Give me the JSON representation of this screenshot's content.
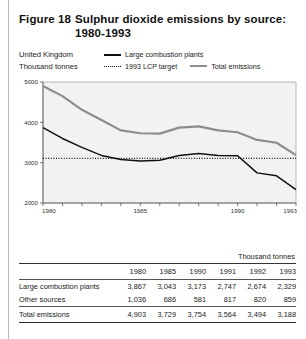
{
  "figure": {
    "number": "Figure 18",
    "title_line1": "Sulphur dioxide emissions by source:",
    "title_line2": "1980-1993"
  },
  "subhead": {
    "region": "United Kingdom",
    "units": "Thousand tonnes"
  },
  "legend": {
    "large_combustion_plants": "Large combustion plants",
    "lcp_target": "1993 LCP target",
    "total_emissions": "Total emissions"
  },
  "table": {
    "units_label": "Thousand tonnes",
    "columns": [
      "1980",
      "1985",
      "1990",
      "1991",
      "1992",
      "1993"
    ],
    "rows": [
      {
        "label": "Large combustion plants",
        "values": [
          "3,867",
          "3,043",
          "3,173",
          "2,747",
          "2,674",
          "2,329"
        ]
      },
      {
        "label": "Other sources",
        "values": [
          "1,036",
          "686",
          "581",
          "817",
          "820",
          "859"
        ]
      }
    ],
    "total_row": {
      "label": "Total emissions",
      "values": [
        "4,903",
        "3,729",
        "3,754",
        "3,564",
        "3,494",
        "3,188"
      ]
    }
  },
  "chart_data": {
    "type": "line",
    "title": "Sulphur dioxide emissions by source: 1980-1993",
    "xlabel": "",
    "ylabel": "Thousand tonnes",
    "xlim": [
      1980,
      1993
    ],
    "ylim": [
      2000,
      5000
    ],
    "yticks": [
      2000,
      3000,
      4000,
      5000
    ],
    "ytick_labels": [
      "2000",
      "3000",
      "4000",
      "5000"
    ],
    "xticks": [
      1980,
      1981,
      1982,
      1983,
      1984,
      1985,
      1986,
      1987,
      1988,
      1989,
      1990,
      1991,
      1992,
      1993
    ],
    "xtick_labels_shown": [
      "1980",
      "1985",
      "1990",
      "1993"
    ],
    "grid": false,
    "legend_position": "top",
    "x": [
      1980,
      1981,
      1982,
      1983,
      1984,
      1985,
      1986,
      1987,
      1988,
      1989,
      1990,
      1991,
      1992,
      1993
    ],
    "series": [
      {
        "name": "Total emissions",
        "color": "#8d8d8d",
        "style": "solid",
        "values": [
          4903,
          4650,
          4310,
          4060,
          3800,
          3729,
          3720,
          3870,
          3900,
          3800,
          3754,
          3564,
          3494,
          3188
        ]
      },
      {
        "name": "Large combustion plants",
        "color": "#101010",
        "style": "solid",
        "values": [
          3867,
          3600,
          3380,
          3180,
          3080,
          3043,
          3060,
          3180,
          3230,
          3180,
          3173,
          2747,
          2674,
          2329
        ]
      },
      {
        "name": "1993 LCP target",
        "color": "#101010",
        "style": "dotted",
        "values": [
          3106,
          3106,
          3106,
          3106,
          3106,
          3106,
          3106,
          3106,
          3106,
          3106,
          3106,
          3106,
          3106,
          3106
        ]
      }
    ],
    "plot_background": "#f2f2f2"
  }
}
